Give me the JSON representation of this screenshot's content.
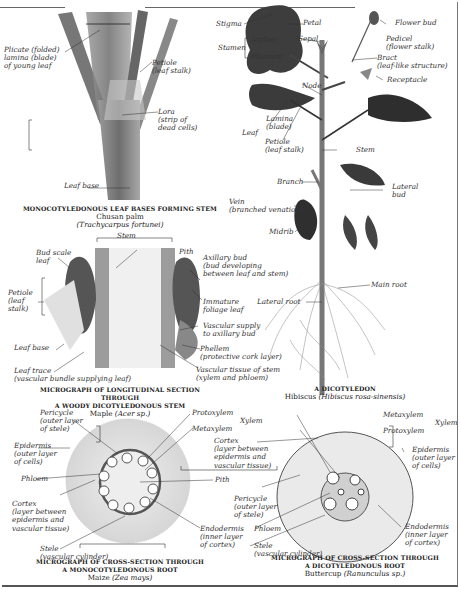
{
  "plate": {
    "panels": [
      {
        "id": "palm",
        "caption_title": "Monocotyledonous leaf bases forming stem",
        "caption_common": "Chusan palm",
        "caption_species": "(Trachycarpus fortunei)",
        "labels": {
          "plicate": "Plicate (folded)\nlamina (blade)\nof young leaf",
          "petiole": "Petiole\n(leaf stalk)",
          "lora": "Lora\n(strip of\ndead cells)",
          "leaf_base": "Leaf base"
        }
      },
      {
        "id": "hibiscus",
        "caption_title": "A dicotyledon",
        "caption_common": "Hibiscus",
        "caption_species": "(Hibiscus rosa-sinensis)",
        "labels": {
          "stigma": "Stigma",
          "stamen": "Stamen",
          "anther": "Anther",
          "filament": "Filament",
          "petal": "Petal",
          "sepal": "Sepal",
          "flower_bud": "Flower bud",
          "pedicel": "Pedicel\n(flower stalk)",
          "bract": "Bract\n(leaf-like structure)",
          "receptacle": "Receptacle",
          "node": "Node",
          "leaf": "Leaf",
          "lamina": "Lamina\n(blade)",
          "petiole": "Petiole\n(leaf stalk)",
          "stem": "Stem",
          "branch": "Branch",
          "lateral_bud": "Lateral\nbud",
          "vein": "Vein\n(branched venation)",
          "midrib": "Midrib",
          "main_root": "Main root",
          "lateral_root": "Lateral root"
        }
      },
      {
        "id": "maple",
        "caption_title": "Micrograph of longitudinal section through\na woody dicotyledonous stem",
        "caption_common": "Maple",
        "caption_species": "(Acer sp.)",
        "labels": {
          "stem": "Stem",
          "pith": "Pith",
          "bud_scale": "Bud scale\nleaf",
          "petiole": "Petiole\n(leaf\nstalk)",
          "axillary_bud": "Axillary bud\n(bud developing\nbetween leaf and stem)",
          "immature_leaf": "Immature\nfoliage leaf",
          "vascular_supply": "Vascular supply\nto axillary bud",
          "phellem": "Phellem\n(protective cork layer)",
          "vascular_tissue": "Vascular tissue of stem\n(xylem and phloem)",
          "leaf_base": "Leaf base",
          "leaf_trace": "Leaf trace\n(vascular bundle supplying leaf)"
        }
      },
      {
        "id": "maize",
        "caption_title": "Micrograph of cross-section through\na monocotyledonous root",
        "caption_common": "Maize",
        "caption_species": "(Zea mays)",
        "labels": {
          "pericycle": "Pericycle\n(outer layer\nof stele)",
          "protoxylem": "Protoxylem",
          "metaxylem": "Metaxylem",
          "xylem": "Xylem",
          "epidermis": "Epidermis\n(outer layer\nof cells)",
          "phloem": "Phloem",
          "pith": "Pith",
          "cortex": "Cortex\n(layer between\nepidermis and\nvascular tissue)",
          "endodermis": "Endodermis\n(inner layer\nof cortex)",
          "stele": "Stele\n(vascular cylinder)"
        }
      },
      {
        "id": "buttercup",
        "caption_title": "Micrograph of cross-section through\na dicotyledonous root",
        "caption_common": "Buttercup",
        "caption_species": "(Ranunculus sp.)",
        "labels": {
          "metaxylem": "Metaxylem",
          "protoxylem": "Protoxylem",
          "xylem": "Xylem",
          "cortex": "Cortex\n(layer between\nepidermis and\nvascular tissue)",
          "epidermis": "Epidermis\n(outer layer\nof cells)",
          "pericycle": "Pericycle\n(outer layer\nof stele)",
          "phloem": "Phloem",
          "stele": "Stele\n(vascular cylinder)",
          "endodermis": "Endodermis\n(inner layer\nof cortex)"
        }
      }
    ]
  },
  "colors": {
    "plant_dark": "#3a3a3a",
    "stem_mid": "#8a8a8a",
    "tissue_light": "#dcdcdc",
    "paper": "#ffffff",
    "line": "#444444"
  }
}
